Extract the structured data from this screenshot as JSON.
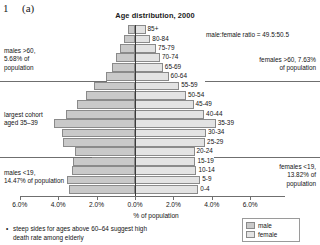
{
  "figure": {
    "number": "1",
    "letter": "(a)"
  },
  "chart_data": {
    "type": "bar",
    "subtype": "population-pyramid",
    "title": "Age distribution, 2000",
    "xlabel": "% of population",
    "ylabel": "",
    "grid": false,
    "legend_position": "bottom-right",
    "xlim": [
      -6.5,
      6.5
    ],
    "xticks": [
      "6.0%",
      "4.0%",
      "2.0%",
      "0.0%",
      "2.0%",
      "4.0%",
      "6.0%"
    ],
    "xtick_values": [
      -6.0,
      -4.0,
      -2.0,
      0.0,
      2.0,
      4.0,
      6.0
    ],
    "categories": [
      "0-4",
      "5-9",
      "10-14",
      "15-19",
      "20-24",
      "25-29",
      "30-34",
      "35-39",
      "40-44",
      "45-49",
      "50-54",
      "55-59",
      "60-64",
      "65-69",
      "70-74",
      "75-79",
      "80-84",
      "85+"
    ],
    "series": [
      {
        "name": "male",
        "color": "#c9c9c9",
        "values": [
          3.45,
          3.55,
          3.3,
          3.25,
          3.15,
          3.75,
          3.8,
          4.2,
          3.6,
          3.0,
          2.55,
          2.15,
          1.5,
          1.2,
          1.0,
          0.8,
          0.55,
          0.35
        ]
      },
      {
        "name": "female",
        "color": "#e3e3e3",
        "values": [
          3.3,
          3.4,
          3.2,
          3.15,
          3.1,
          3.65,
          3.7,
          4.2,
          3.6,
          3.05,
          2.65,
          2.3,
          1.75,
          1.45,
          1.3,
          1.1,
          0.8,
          0.55
        ]
      }
    ],
    "legend": [
      {
        "label": "male",
        "color": "#c9c9c9"
      },
      {
        "label": "female",
        "color": "#e3e3e3"
      }
    ]
  },
  "annotations": {
    "males_over_60": "males >60,\n5.68% of\npopulation",
    "males_over_60_l1": "males >60,",
    "males_over_60_l2": "5.68% of",
    "males_over_60_l3": "population",
    "largest_cohort_l1": "largest cohort",
    "largest_cohort_l2": "aged 35–39",
    "males_under_19_l1": "males <19,",
    "males_under_19_l2": "14.47% of population",
    "ratio": "male:female ratio = 49.5:50.5",
    "females_over_60_l1": "females >60, 7.63%",
    "females_over_60_l2": "of population",
    "females_under_19_l1": "females <19,",
    "females_under_19_l2": "13.82% of",
    "females_under_19_l3": "population"
  },
  "note": {
    "bullet": "•",
    "line1": "steep sides for ages above 60–64 suggest high",
    "line2": "death rate among elderly"
  }
}
